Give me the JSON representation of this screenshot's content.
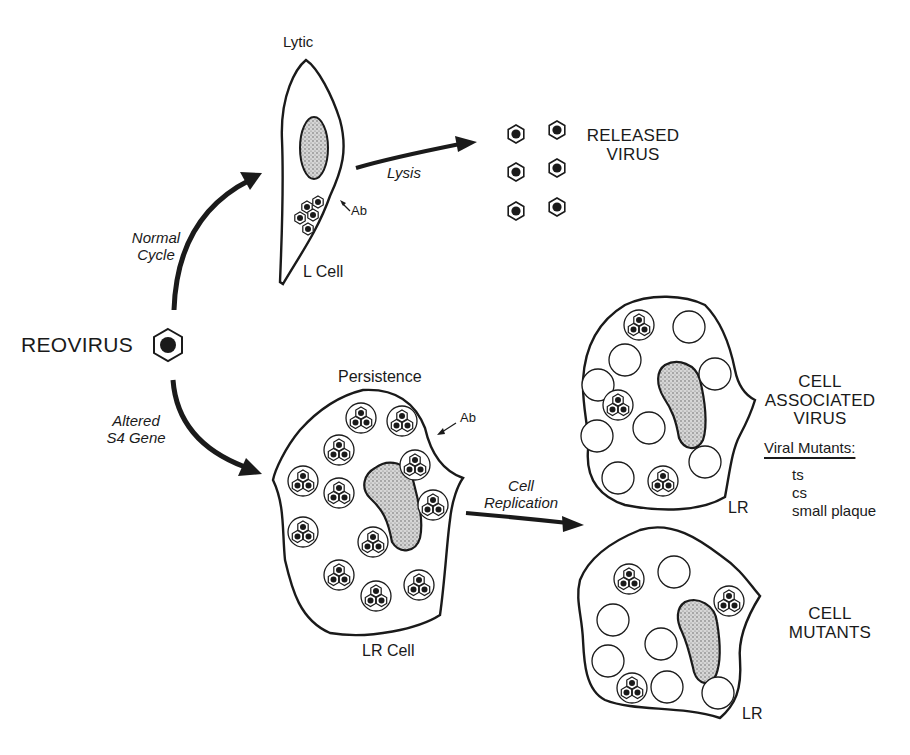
{
  "figure": {
    "source_label": "REOVIRUS",
    "pathways": {
      "lytic": {
        "arrow_label": [
          "Normal",
          "Cycle"
        ],
        "cell_state": "Lytic",
        "cell_name": "L Cell",
        "antibody_label": "Ab",
        "transition_label": "Lysis",
        "outcome_label": [
          "RELEASED",
          "VIRUS"
        ],
        "released_particle_count": 6
      },
      "persistent": {
        "arrow_label": [
          "Altered",
          "S4 Gene"
        ],
        "cell_state": "Persistence",
        "cell_name": "LR Cell",
        "antibody_label": "Ab",
        "transition_label": [
          "Cell",
          "Replication"
        ],
        "daughter_cells": [
          {
            "name": "LR",
            "outcome_label": [
              "CELL",
              "ASSOCIATED",
              "VIRUS"
            ],
            "mutants_heading": "Viral Mutants:",
            "mutants": [
              "ts",
              "cs",
              "small plaque"
            ]
          },
          {
            "name": "LR",
            "outcome_label": [
              "CELL",
              "MUTANTS"
            ]
          }
        ]
      }
    },
    "colors": {
      "ink": "#1a1a1a",
      "nucleus_fill": "#bdbdbd",
      "background": "#ffffff"
    }
  }
}
